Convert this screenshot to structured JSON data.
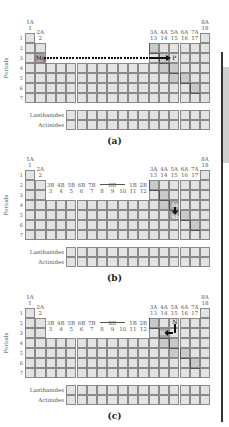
{
  "figure": {
    "panels": [
      {
        "id": "a",
        "caption": "(a)",
        "groups_top": [
          {
            "label": "1A",
            "num": "1"
          },
          {
            "label": "2A",
            "num": "2"
          },
          {
            "label": "3A",
            "num": "13"
          },
          {
            "label": "4A",
            "num": "14"
          },
          {
            "label": "5A",
            "num": "15"
          },
          {
            "label": "6A",
            "num": "16"
          },
          {
            "label": "7A",
            "num": "17"
          },
          {
            "label": "8A",
            "num": "18"
          }
        ],
        "transition_groups": [],
        "periods_label": "Periods",
        "period_numbers": [
          "1",
          "2",
          "3",
          "4",
          "5",
          "6",
          "7"
        ],
        "lanthanides_label": "Lanthanides",
        "actinides_label": "Actinides",
        "elements": [
          {
            "symbol": "Mg"
          },
          {
            "symbol": "P"
          }
        ],
        "arrow": "Mg to P, across period 3 (dotted then solid)"
      },
      {
        "id": "b",
        "caption": "(b)",
        "groups_top": [
          {
            "label": "1A",
            "num": "1"
          },
          {
            "label": "2A",
            "num": "2"
          },
          {
            "label": "3A",
            "num": "13"
          },
          {
            "label": "4A",
            "num": "14"
          },
          {
            "label": "5A",
            "num": "15"
          },
          {
            "label": "6A",
            "num": "16"
          },
          {
            "label": "7A",
            "num": "17"
          },
          {
            "label": "8A",
            "num": "18"
          }
        ],
        "transition_groups": [
          {
            "label": "3B",
            "num": "3"
          },
          {
            "label": "4B",
            "num": "4"
          },
          {
            "label": "5B",
            "num": "5"
          },
          {
            "label": "6B",
            "num": "6"
          },
          {
            "label": "7B",
            "num": "7"
          },
          {
            "label": "",
            "num": "8"
          },
          {
            "label": "8B",
            "num": "9"
          },
          {
            "label": "",
            "num": "10"
          },
          {
            "label": "1B",
            "num": "11"
          },
          {
            "label": "2B",
            "num": "12"
          }
        ],
        "periods_label": "Periods",
        "period_numbers": [
          "1",
          "2",
          "3",
          "4",
          "5",
          "6",
          "7"
        ],
        "lanthanides_label": "Lanthanides",
        "actinides_label": "Actinides",
        "elements": [
          {
            "symbol": "As"
          },
          {
            "symbol": "Sb"
          }
        ],
        "arrow": "As down to Sb in group 5A"
      },
      {
        "id": "c",
        "caption": "(c)",
        "groups_top": [
          {
            "label": "1A",
            "num": "1"
          },
          {
            "label": "2A",
            "num": "2"
          },
          {
            "label": "3A",
            "num": "13"
          },
          {
            "label": "4A",
            "num": "14"
          },
          {
            "label": "5A",
            "num": "15"
          },
          {
            "label": "6A",
            "num": "16"
          },
          {
            "label": "7A",
            "num": "17"
          },
          {
            "label": "8A",
            "num": "18"
          }
        ],
        "transition_groups": [
          {
            "label": "3B",
            "num": "3"
          },
          {
            "label": "4B",
            "num": "4"
          },
          {
            "label": "5B",
            "num": "5"
          },
          {
            "label": "6B",
            "num": "6"
          },
          {
            "label": "7B",
            "num": "7"
          },
          {
            "label": "",
            "num": "8"
          },
          {
            "label": "8B",
            "num": "9"
          },
          {
            "label": "",
            "num": "10"
          },
          {
            "label": "1B",
            "num": "11"
          },
          {
            "label": "2B",
            "num": "12"
          }
        ],
        "periods_label": "Periods",
        "period_numbers": [
          "1",
          "2",
          "3",
          "4",
          "5",
          "6",
          "7"
        ],
        "lanthanides_label": "Lanthanides",
        "actinides_label": "Actinides",
        "elements": [
          {
            "symbol": "N"
          },
          {
            "symbol": "Si"
          }
        ],
        "arrow": "N down then left to Si"
      }
    ]
  }
}
